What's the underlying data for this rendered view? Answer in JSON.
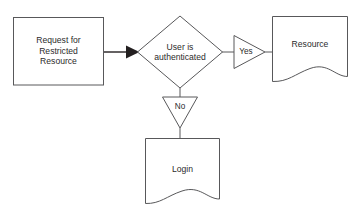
{
  "diagram": {
    "type": "flowchart",
    "background_color": "#ffffff",
    "stroke_color": "#58585a",
    "arrow_fill_color": "#231f20",
    "text_color": "#2b2b2b",
    "nodes": [
      {
        "id": "request",
        "shape": "process-rectangle",
        "label": "Request for\nRestricted\nResource"
      },
      {
        "id": "decision",
        "shape": "decision-diamond",
        "label": "User is\nauthenticated"
      },
      {
        "id": "yes",
        "shape": "triangle-right",
        "label": "Yes"
      },
      {
        "id": "no",
        "shape": "triangle-down",
        "label": "No"
      },
      {
        "id": "resource",
        "shape": "document-wavy",
        "label": "Resource"
      },
      {
        "id": "login",
        "shape": "document-wavy",
        "label": "Login"
      }
    ],
    "edges": [
      {
        "from": "request",
        "to": "decision",
        "arrowhead": true
      },
      {
        "from": "decision",
        "to": "yes",
        "arrowhead": false
      },
      {
        "from": "yes",
        "to": "resource",
        "arrowhead": false
      },
      {
        "from": "decision",
        "to": "no",
        "arrowhead": false
      },
      {
        "from": "no",
        "to": "login",
        "arrowhead": false
      }
    ]
  }
}
